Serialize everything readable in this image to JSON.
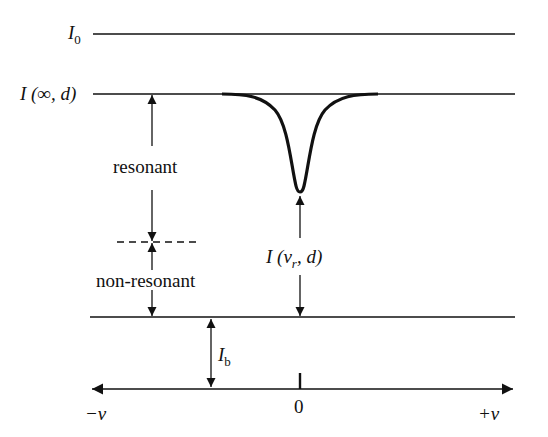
{
  "labels": {
    "i0": {
      "main": "I",
      "sub": "0"
    },
    "i_inf": "I (∞, d)",
    "resonant": "resonant",
    "non_resonant": "non-resonant",
    "i_vr": {
      "pre": "I (v",
      "sub": "r",
      "post": ", d)"
    },
    "ib": {
      "main": "I",
      "sub": "b"
    },
    "axis_left": "−ν",
    "axis_zero": "0",
    "axis_right": "+ν"
  }
}
